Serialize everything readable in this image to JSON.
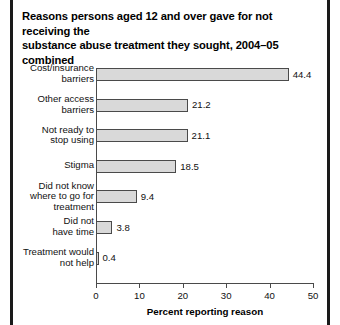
{
  "chart_data": {
    "type": "bar",
    "orientation": "horizontal",
    "title": "Reasons persons aged 12 and over gave for not receiving the substance abuse treatment they sought, 2004–05 combined",
    "title_line1": "Reasons persons aged 12 and over gave for not receiving the",
    "title_line2": "substance abuse treatment they sought, 2004–05 combined",
    "xlabel": "Percent reporting reason",
    "ylabel": "",
    "xlim": [
      0,
      50
    ],
    "xticks": [
      "0",
      "10",
      "20",
      "30",
      "40",
      "50"
    ],
    "grid": false,
    "legend": "none",
    "bar_color": "#d9d9d9",
    "bar_edge_color": "#4a4a4a",
    "categories": [
      "Cost/insurance barriers",
      "Other access barriers",
      "Not ready to stop using",
      "Stigma",
      "Did not know where to go for treatment",
      "Did not have time",
      "Treatment would not help"
    ],
    "values": [
      44.4,
      21.2,
      21.1,
      18.5,
      9.4,
      3.8,
      0.4
    ],
    "value_labels": [
      "44.4",
      "21.2",
      "21.1",
      "18.5",
      "9.4",
      "3.8",
      "0.4"
    ],
    "bars": [
      {
        "label_line1": "Cost/insurance",
        "label_line2": "barriers",
        "label_line3": "",
        "value": 44.4,
        "value_label": "44.4"
      },
      {
        "label_line1": "Other access",
        "label_line2": "barriers",
        "label_line3": "",
        "value": 21.2,
        "value_label": "21.2"
      },
      {
        "label_line1": "Not ready to",
        "label_line2": "stop using",
        "label_line3": "",
        "value": 21.1,
        "value_label": "21.1"
      },
      {
        "label_line1": "Stigma",
        "label_line2": "",
        "label_line3": "",
        "value": 18.5,
        "value_label": "18.5"
      },
      {
        "label_line1": "Did not know",
        "label_line2": "where to go for",
        "label_line3": "treatment",
        "value": 9.4,
        "value_label": "9.4"
      },
      {
        "label_line1": "Did not",
        "label_line2": "have time",
        "label_line3": "",
        "value": 3.8,
        "value_label": "3.8"
      },
      {
        "label_line1": "Treatment would",
        "label_line2": "not help",
        "label_line3": "",
        "value": 0.4,
        "value_label": "0.4"
      }
    ]
  }
}
